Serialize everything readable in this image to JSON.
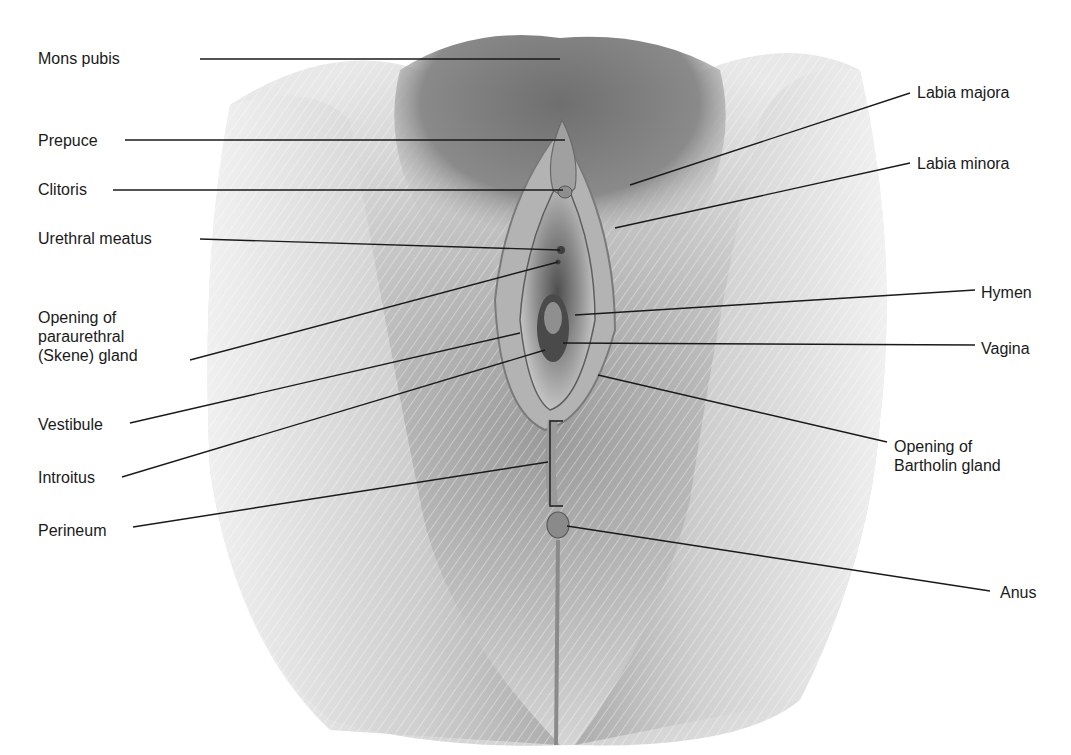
{
  "figure": {
    "type": "anatomical-illustration",
    "style": "grayscale pencil illustration",
    "background_color": "#ffffff",
    "leader_line_color": "#1a1a1a",
    "label_color": "#1a1a1a"
  },
  "labels_left": [
    {
      "id": "mons-pubis",
      "text": "Mons pubis",
      "x": 38,
      "y": 49,
      "line": [
        [
          200,
          59
        ],
        [
          560,
          59
        ]
      ]
    },
    {
      "id": "prepuce",
      "text": "Prepuce",
      "x": 38,
      "y": 131,
      "line": [
        [
          125,
          140
        ],
        [
          565,
          140
        ]
      ]
    },
    {
      "id": "clitoris",
      "text": "Clitoris",
      "x": 38,
      "y": 180,
      "line": [
        [
          113,
          190
        ],
        [
          563,
          190
        ]
      ]
    },
    {
      "id": "urethral-meatus",
      "text": "Urethral meatus",
      "x": 38,
      "y": 229,
      "line": [
        [
          200,
          239
        ],
        [
          560,
          250
        ]
      ]
    },
    {
      "id": "skene-gland",
      "text": "Opening of\nparaurethral\n(Skene) gland",
      "x": 38,
      "y": 308,
      "line": [
        [
          190,
          360
        ],
        [
          558,
          262
        ]
      ]
    },
    {
      "id": "vestibule",
      "text": "Vestibule",
      "x": 38,
      "y": 415,
      "line": [
        [
          130,
          423
        ],
        [
          520,
          333
        ]
      ]
    },
    {
      "id": "introitus",
      "text": "Introitus",
      "x": 38,
      "y": 468,
      "line": [
        [
          122,
          477
        ],
        [
          545,
          350
        ]
      ]
    },
    {
      "id": "perineum",
      "text": "Perineum",
      "x": 38,
      "y": 521,
      "line": [
        [
          133,
          527
        ],
        [
          548,
          462
        ]
      ]
    }
  ],
  "labels_right": [
    {
      "id": "labia-majora",
      "text": "Labia majora",
      "x": 917,
      "y": 83,
      "line": [
        [
          910,
          93
        ],
        [
          630,
          185
        ]
      ]
    },
    {
      "id": "labia-minora",
      "text": "Labia minora",
      "x": 917,
      "y": 154,
      "line": [
        [
          910,
          163
        ],
        [
          615,
          228
        ]
      ]
    },
    {
      "id": "hymen",
      "text": "Hymen",
      "x": 981,
      "y": 283,
      "line": [
        [
          975,
          290
        ],
        [
          575,
          315
        ]
      ]
    },
    {
      "id": "vagina",
      "text": "Vagina",
      "x": 981,
      "y": 339,
      "line": [
        [
          975,
          345
        ],
        [
          563,
          343
        ]
      ]
    },
    {
      "id": "bartholin-gland",
      "text": "Opening of\nBartholin gland",
      "x": 894,
      "y": 437,
      "line": [
        [
          887,
          442
        ],
        [
          598,
          375
        ]
      ]
    },
    {
      "id": "anus",
      "text": "Anus",
      "x": 1000,
      "y": 583,
      "line": [
        [
          990,
          591
        ],
        [
          567,
          526
        ]
      ]
    }
  ],
  "perineum_bracket": {
    "x": 550,
    "top": 421,
    "bottom": 506,
    "tick": 13
  }
}
